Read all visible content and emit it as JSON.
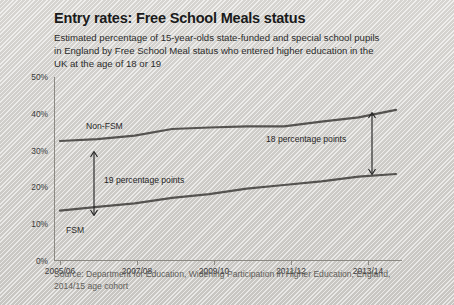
{
  "title": "Entry rates: Free School Meals status",
  "subtitle": "Estimated percentage of 15-year-olds state-funded and special school pupils in England by Free School Meal status who entered higher education in the UK at the age of 18 or 19",
  "source": "Source: Department for Education, Widening Participation in Higher Education, England, 2014/15 age cohort",
  "colors": {
    "line": "#555350",
    "axis": "#8b8983",
    "text": "#1f1f1f",
    "background": "#d8d6d2"
  },
  "annotations": {
    "gap_left": "19 percentage points",
    "gap_right": "18 percentage points"
  },
  "chart_data": {
    "type": "line",
    "title": "Entry rates: Free School Meals status",
    "xlabel": "",
    "ylabel": "",
    "ylim": [
      0,
      50
    ],
    "yticks": [
      "0%",
      "10%",
      "20%",
      "30%",
      "40%",
      "50%"
    ],
    "ytick_values": [
      0,
      10,
      20,
      30,
      40,
      50
    ],
    "grid": false,
    "legend": "inline-labels",
    "x": [
      "2005/06",
      "2006/07",
      "2007/08",
      "2008/09",
      "2009/10",
      "2010/11",
      "2011/12",
      "2012/13",
      "2013/14",
      "2014/15"
    ],
    "xtick_labels": [
      "2005/06",
      "2007/08",
      "2009/10",
      "2011/12",
      "2013/14"
    ],
    "series": [
      {
        "name": "Non-FSM",
        "values": [
          32.5,
          33.0,
          34.0,
          35.8,
          36.2,
          36.5,
          36.5,
          37.8,
          39.0,
          41.0
        ]
      },
      {
        "name": "FSM",
        "values": [
          13.5,
          14.5,
          15.5,
          17.0,
          18.0,
          19.5,
          20.5,
          21.5,
          22.8,
          23.5
        ]
      }
    ]
  }
}
